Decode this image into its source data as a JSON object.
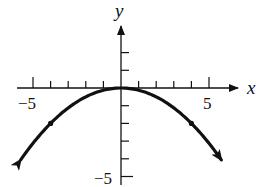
{
  "chart_data": {
    "type": "line",
    "title": "",
    "xlabel": "x",
    "ylabel": "y",
    "xlim": [
      -5.6,
      5.6
    ],
    "ylim": [
      -5,
      2.6
    ],
    "x_ticks": [
      -5,
      -4,
      -3,
      -2,
      -1,
      1,
      2,
      3,
      4,
      5
    ],
    "y_ticks": [
      -5,
      -4,
      -3,
      -2,
      -1,
      1,
      2
    ],
    "x_tick_labels": [
      {
        "value": -5,
        "label": "-5"
      },
      {
        "value": 5,
        "label": "5"
      }
    ],
    "y_tick_labels": [
      {
        "value": -5,
        "label": "-5"
      }
    ],
    "grid": false,
    "legend": null,
    "series": [
      {
        "name": "y = -x^2/8",
        "equation": "y = -x^2/8",
        "x": [
          -5.6,
          -5,
          -4,
          -3,
          -2,
          -1,
          0,
          1,
          2,
          3,
          4,
          5,
          5.6
        ],
        "y": [
          -3.92,
          -3.125,
          -2,
          -1.125,
          -0.5,
          -0.125,
          0,
          -0.125,
          -0.5,
          -1.125,
          -2,
          -3.125,
          -3.92
        ],
        "arrows_at_ends": true,
        "marked_points": [
          {
            "x": -4,
            "y": -2
          },
          {
            "x": 4,
            "y": -2
          }
        ],
        "color": "#111111"
      }
    ]
  },
  "axes": {
    "x_label": "x",
    "y_label": "y",
    "x_neg_label": "−5",
    "x_pos_label": "5",
    "y_neg_label": "−5"
  }
}
